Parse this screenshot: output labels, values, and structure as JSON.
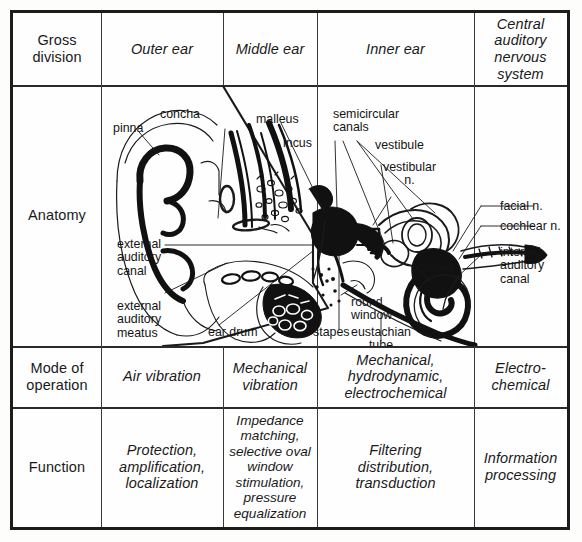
{
  "figure": {
    "kind": "anatomical-table",
    "border_color": "#1c1c1c",
    "background": "#fdfdfc"
  },
  "table": {
    "row_labels": [
      "Gross\ndivision",
      "Anatomy",
      "Mode of\noperation",
      "Function"
    ],
    "columns": [
      "Outer ear",
      "Middle ear",
      "Inner ear",
      "Central\nauditory\nnervous\nsystem"
    ],
    "rows": [
      {
        "label": "Gross\ndivision",
        "cells": [
          "Outer ear",
          "Middle ear",
          "Inner ear",
          "Central\nauditory\nnervous\nsystem"
        ]
      },
      {
        "label": "Anatomy",
        "cells": [
          "",
          "",
          "",
          ""
        ]
      },
      {
        "label": "Mode of\noperation",
        "cells": [
          "Air vibration",
          "Mechanical\nvibration",
          "Mechanical,\nhydrodynamic,\nelectrochemical",
          "Electro-\nchemical"
        ]
      },
      {
        "label": "Function",
        "cells": [
          "Protection,\namplification,\nlocalization",
          "Impedance\nmatching,\nselective oval\nwindow\nstimulation,\npressure\nequalization",
          "Filtering\ndistribution,\ntransduction",
          "Information\nprocessing"
        ]
      }
    ]
  },
  "anatomy": {
    "title": "Anatomy",
    "annotations": [
      {
        "id": "pinna",
        "text": "pinna"
      },
      {
        "id": "concha",
        "text": "concha"
      },
      {
        "id": "malleus",
        "text": "malleus"
      },
      {
        "id": "incus",
        "text": "incus"
      },
      {
        "id": "semicircular-canals",
        "text": "semicircular\ncanals"
      },
      {
        "id": "vestibule",
        "text": "vestibule"
      },
      {
        "id": "vestibular-n",
        "text": "vestibular\nn."
      },
      {
        "id": "facial-n",
        "text": "facial n."
      },
      {
        "id": "cochlear-n",
        "text": "cochlear n."
      },
      {
        "id": "internal-auditory-canal",
        "text": "internal\nauditory\ncanal"
      },
      {
        "id": "external-auditory-canal",
        "text": "external\nauditory\ncanal"
      },
      {
        "id": "external-auditory-meatus",
        "text": "external\nauditory\nmeatus"
      },
      {
        "id": "ear-drum",
        "text": "ear drum"
      },
      {
        "id": "stapes",
        "text": "stapes"
      },
      {
        "id": "round-window",
        "text": "round\nwindow"
      },
      {
        "id": "eustachian-tube",
        "text": "eustachian\ntube"
      },
      {
        "id": "cochlea",
        "text": "cochlea"
      }
    ]
  }
}
